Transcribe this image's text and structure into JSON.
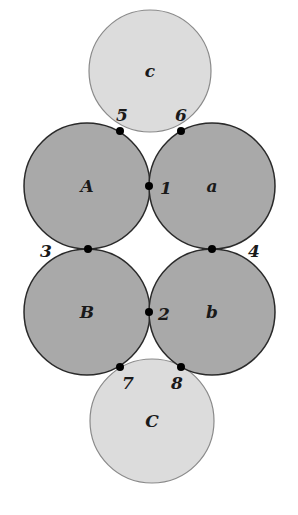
{
  "colors": {
    "dark_circle_fill": "#a9a9a9",
    "light_circle_fill": "#dcdcdc",
    "stroke": "#2a2a2a",
    "light_stroke": "#8a8a8a",
    "dot": "#000000"
  },
  "circles": [
    {
      "id": "c",
      "label": "c",
      "cx": 150,
      "cy": 71,
      "r": 61,
      "shade": "light"
    },
    {
      "id": "C",
      "label": "C",
      "cx": 152,
      "cy": 421,
      "r": 62,
      "shade": "light"
    },
    {
      "id": "A",
      "label": "A",
      "cx": 87,
      "cy": 186,
      "r": 63,
      "shade": "dark"
    },
    {
      "id": "a",
      "label": "a",
      "cx": 212,
      "cy": 186,
      "r": 63,
      "shade": "dark"
    },
    {
      "id": "B",
      "label": "B",
      "cx": 87,
      "cy": 312,
      "r": 63,
      "shade": "dark"
    },
    {
      "id": "b",
      "label": "b",
      "cx": 212,
      "cy": 312,
      "r": 63,
      "shade": "dark"
    }
  ],
  "points": [
    {
      "label": "1",
      "x": 149,
      "y": 186,
      "lx": 160,
      "ly": 194
    },
    {
      "label": "2",
      "x": 149,
      "y": 312,
      "lx": 158,
      "ly": 320
    },
    {
      "label": "3",
      "x": 88,
      "y": 249,
      "lx": 40,
      "ly": 257
    },
    {
      "label": "4",
      "x": 212,
      "y": 249,
      "lx": 248,
      "ly": 257
    },
    {
      "label": "5",
      "x": 120,
      "y": 131,
      "lx": 116,
      "ly": 121
    },
    {
      "label": "6",
      "x": 181,
      "y": 131,
      "lx": 175,
      "ly": 121
    },
    {
      "label": "7",
      "x": 120,
      "y": 367,
      "lx": 122,
      "ly": 389
    },
    {
      "label": "8",
      "x": 181,
      "y": 367,
      "lx": 171,
      "ly": 389
    }
  ]
}
